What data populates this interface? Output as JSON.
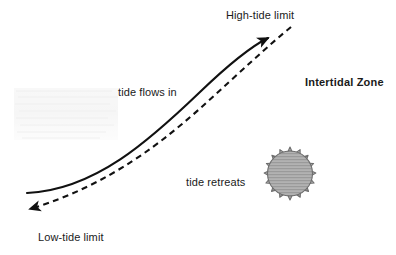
{
  "diagram": {
    "background_color": "#ffffff",
    "line_color": "#111111",
    "sun_fill_color": "#a9a9a9",
    "sun_stroke_color": "#6e6e6e",
    "labels": {
      "high_tide_limit": "High-tide limit",
      "tide_flows_in": "tide flows in",
      "intertidal_zone": "Intertidal Zone",
      "tide_retreats": "tide retreats",
      "low_tide_limit": "Low-tide limit"
    },
    "icons": {
      "sunburst": "sunburst-icon",
      "high_tide_arrow": "arrow-up-right-icon",
      "low_tide_arrow": "arrow-left-icon"
    },
    "curves": {
      "high_tide_curve_style": "solid",
      "low_tide_curve_style": "dashed"
    }
  }
}
